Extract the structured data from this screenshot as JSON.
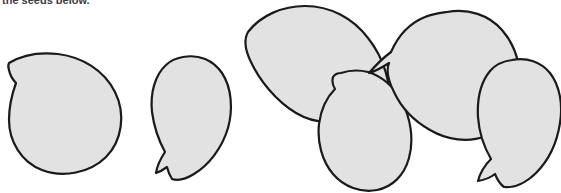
{
  "page": {
    "width": 561,
    "height": 193,
    "background_color": "#ffffff"
  },
  "caption": {
    "text": "the seeds below.",
    "color": "#3d3d3d",
    "note": "Text is cropped by the top edge of the scan; only the lower portion of the glyphs is visible."
  },
  "figure": {
    "shape_count": 6,
    "fill_color": "#e2e2e2",
    "stroke_color": "#1a1a1a",
    "stroke_width": 2.2,
    "shapes": [
      {
        "id": "seed-1",
        "label": "Seed 1",
        "description": "teardrop seed pointing up-left with a small notch at the tip",
        "path": "M 9 63 C 22 55 40 52 58 54 C 82 57 104 70 115 92 C 126 114 122 141 106 157 C 90 173 63 178 42 170 C 21 162 9 141 9 120 C 9 106 12 94 16 83 C 13 80 10 75 9 70 C 8 67 8 65 9 63 Z"
      },
      {
        "id": "seed-2",
        "label": "Seed 2",
        "description": "narrow leaf-shaped seed pointing down with a small tail",
        "path": "M 183 57 C 199 54 213 60 222 73 C 232 88 233 110 228 128 C 222 148 209 165 194 174 C 186 179 178 181 172 179 C 170 176 168 171 167 167 C 163 170 159 172 156 173 C 157 166 161 158 165 152 C 159 141 154 127 152 112 C 150 93 155 75 166 65 C 171 60 177 58 183 57 Z"
      },
      {
        "id": "seed-3",
        "label": "Seed 3",
        "description": "large tilted seed with a pointed tail at lower right",
        "path": "M 248 32 C 261 15 283 6 305 6 C 330 6 353 18 368 38 C 384 58 392 85 389 108 C 387 122 381 132 372 137 C 365 141 358 141 352 138 C 353 128 353 120 351 114 C 347 117 341 120 334 121 C 322 123 308 120 296 113 C 276 101 259 80 250 60 C 245 49 244 39 248 32 Z"
      },
      {
        "id": "seed-4",
        "label": "Seed 4",
        "description": "teardrop seed pointing up-left with a notch at the tip",
        "path": "M 341 73 C 350 70 360 70 368 72 C 381 76 393 86 401 100 C 411 118 414 140 409 158 C 404 176 392 187 377 190 C 361 193 344 187 333 174 C 322 161 317 142 319 124 C 321 109 327 97 335 89 C 333 86 332 81 333 77 C 335 74 338 73 341 73 Z"
      },
      {
        "id": "seed-5",
        "label": "Seed 5",
        "description": "large rounded seed tilted right with a point at lower left",
        "path": "M 447 12 C 468 8 489 15 502 30 C 517 47 523 72 519 94 C 515 114 503 129 486 136 C 468 143 447 140 430 130 C 414 121 401 107 394 92 C 388 80 386 70 389 63 C 383 67 376 71 369 73 C 375 66 383 58 391 52 C 398 36 410 23 425 17 C 432 14 440 13 447 12 Z"
      },
      {
        "id": "seed-6",
        "label": "Seed 6",
        "description": "seed pointing down-left with a small tail",
        "path": "M 512 60 C 527 57 541 62 550 73 C 560 86 563 105 560 123 C 557 143 548 161 536 173 C 526 183 514 188 504 187 C 500 184 497 179 495 174 C 490 178 484 180 478 181 C 480 173 485 165 491 159 C 484 147 479 132 478 117 C 477 99 481 82 490 71 C 496 64 504 61 512 60 Z"
      }
    ]
  }
}
